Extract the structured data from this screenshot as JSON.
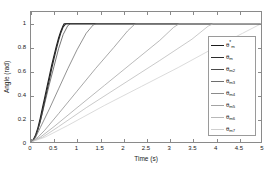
{
  "chart_data": {
    "type": "line",
    "title": "",
    "xlabel": "Time (s)",
    "ylabel": "Angle (rad)",
    "xlim": [
      0,
      5
    ],
    "ylim": [
      0,
      1.1
    ],
    "grid": false,
    "legend_position": "right",
    "xticks": [
      "0",
      "0.5",
      "1",
      "1.5",
      "2",
      "2.5",
      "3",
      "3.5",
      "4",
      "4.5",
      "5"
    ],
    "xtick_values": [
      0,
      0.5,
      1,
      1.5,
      2,
      2.5,
      3,
      3.5,
      4,
      4.5,
      5
    ],
    "yticks": [
      "0",
      "0.2",
      "0.4",
      "0.6",
      "0.8",
      "1"
    ],
    "ytick_values": [
      0,
      0.2,
      0.4,
      0.6,
      0.8,
      1.0
    ],
    "series": [
      {
        "name": "theta_m_ref",
        "label_base": "θ",
        "label_sub": "m",
        "label_sup": "*",
        "color": "#1c1c1c",
        "saturation_time": 0.72,
        "points": [
          [
            0,
            0
          ],
          [
            0.05,
            0.02
          ],
          [
            0.1,
            0.06
          ],
          [
            0.15,
            0.12
          ],
          [
            0.2,
            0.2
          ],
          [
            0.25,
            0.29
          ],
          [
            0.3,
            0.38
          ],
          [
            0.35,
            0.47
          ],
          [
            0.4,
            0.56
          ],
          [
            0.45,
            0.65
          ],
          [
            0.5,
            0.73
          ],
          [
            0.55,
            0.81
          ],
          [
            0.6,
            0.88
          ],
          [
            0.65,
            0.94
          ],
          [
            0.7,
            0.985
          ],
          [
            0.72,
            1.0
          ],
          [
            5,
            1.0
          ]
        ]
      },
      {
        "name": "theta_m",
        "label_base": "θ",
        "label_sub": "m",
        "label_sup": "",
        "color": "#2b2b2b",
        "saturation_time": 0.78,
        "points": [
          [
            0,
            0
          ],
          [
            0.05,
            0.015
          ],
          [
            0.1,
            0.05
          ],
          [
            0.15,
            0.105
          ],
          [
            0.2,
            0.175
          ],
          [
            0.25,
            0.26
          ],
          [
            0.3,
            0.35
          ],
          [
            0.35,
            0.44
          ],
          [
            0.4,
            0.53
          ],
          [
            0.45,
            0.62
          ],
          [
            0.5,
            0.705
          ],
          [
            0.55,
            0.785
          ],
          [
            0.6,
            0.86
          ],
          [
            0.65,
            0.925
          ],
          [
            0.7,
            0.975
          ],
          [
            0.75,
            0.998
          ],
          [
            0.78,
            1.0
          ],
          [
            5,
            1.0
          ]
        ]
      },
      {
        "name": "theta_m2",
        "label_base": "θ",
        "label_sub": "m2",
        "label_sup": "",
        "color": "#4a4a4a",
        "saturation_time": 0.86,
        "points": [
          [
            0,
            0
          ],
          [
            0.06,
            0.02
          ],
          [
            0.12,
            0.07
          ],
          [
            0.2,
            0.17
          ],
          [
            0.3,
            0.33
          ],
          [
            0.4,
            0.49
          ],
          [
            0.5,
            0.64
          ],
          [
            0.6,
            0.79
          ],
          [
            0.7,
            0.91
          ],
          [
            0.8,
            0.985
          ],
          [
            0.86,
            1.0
          ],
          [
            5,
            1.0
          ]
        ]
      },
      {
        "name": "theta_m3",
        "label_base": "θ",
        "label_sub": "m3",
        "label_sup": "",
        "color": "#6e6e6e",
        "saturation_time": 1.42,
        "points": [
          [
            0,
            0
          ],
          [
            0.1,
            0.04
          ],
          [
            0.2,
            0.12
          ],
          [
            0.4,
            0.28
          ],
          [
            0.6,
            0.45
          ],
          [
            0.8,
            0.62
          ],
          [
            1.0,
            0.78
          ],
          [
            1.2,
            0.92
          ],
          [
            1.35,
            0.99
          ],
          [
            1.42,
            1.0
          ],
          [
            5,
            1.0
          ]
        ]
      },
      {
        "name": "theta_m4",
        "label_base": "θ",
        "label_sub": "m4",
        "label_sup": "",
        "color": "#8b8b8b",
        "saturation_time": 2.28,
        "points": [
          [
            0,
            0
          ],
          [
            0.15,
            0.04
          ],
          [
            0.3,
            0.1
          ],
          [
            0.6,
            0.24
          ],
          [
            1.0,
            0.43
          ],
          [
            1.4,
            0.62
          ],
          [
            1.8,
            0.8
          ],
          [
            2.1,
            0.94
          ],
          [
            2.25,
            0.995
          ],
          [
            2.28,
            1.0
          ],
          [
            5,
            1.0
          ]
        ]
      },
      {
        "name": "theta_m5",
        "label_base": "θ",
        "label_sub": "m5",
        "label_sup": "",
        "color": "#a3a3a3",
        "saturation_time": 3.22,
        "points": [
          [
            0,
            0
          ],
          [
            0.2,
            0.04
          ],
          [
            0.5,
            0.13
          ],
          [
            1.0,
            0.29
          ],
          [
            1.6,
            0.48
          ],
          [
            2.2,
            0.67
          ],
          [
            2.8,
            0.86
          ],
          [
            3.1,
            0.97
          ],
          [
            3.22,
            1.0
          ],
          [
            5,
            1.0
          ]
        ]
      },
      {
        "name": "theta_m6",
        "label_base": "θ",
        "label_sub": "m6",
        "label_sup": "",
        "color": "#b8b8b8",
        "saturation_time": 3.96,
        "points": [
          [
            0,
            0
          ],
          [
            0.25,
            0.04
          ],
          [
            0.6,
            0.13
          ],
          [
            1.2,
            0.29
          ],
          [
            2.0,
            0.49
          ],
          [
            2.8,
            0.69
          ],
          [
            3.5,
            0.87
          ],
          [
            3.85,
            0.98
          ],
          [
            3.96,
            1.0
          ],
          [
            5,
            1.0
          ]
        ]
      },
      {
        "name": "theta_m7",
        "label_base": "θ",
        "label_sub": "m7",
        "label_sup": "",
        "color": "#cfcfcf",
        "saturation_time": 5.0,
        "points": [
          [
            0,
            0
          ],
          [
            0.3,
            0.04
          ],
          [
            0.8,
            0.14
          ],
          [
            1.6,
            0.31
          ],
          [
            2.4,
            0.47
          ],
          [
            3.2,
            0.63
          ],
          [
            4.0,
            0.8
          ],
          [
            4.6,
            0.92
          ],
          [
            5.0,
            1.0
          ]
        ]
      }
    ]
  },
  "axes": {
    "x_title": "Time (s)",
    "y_title": "Angle (rad)"
  }
}
